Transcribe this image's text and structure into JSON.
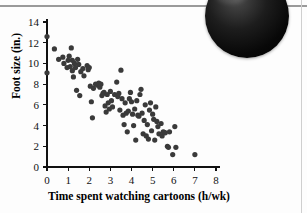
{
  "page": {
    "background_color": "#fdfdfd",
    "rule_color": "#9a9a9a",
    "decor": {
      "corner_blob_name": "dark-circle-photo-fragment",
      "corner_blob_color": "#0a0a0a"
    }
  },
  "chart_data": {
    "type": "scatter",
    "title": "",
    "xlabel": "Time spent watching cartoons (h/wk)",
    "ylabel": "Foot size (in.)",
    "xlim": [
      0,
      8
    ],
    "ylim": [
      0,
      14
    ],
    "xticks": [
      0,
      1,
      2,
      3,
      4,
      5,
      6,
      7,
      8
    ],
    "yticks": [
      0,
      2,
      4,
      6,
      8,
      10,
      12,
      14
    ],
    "xtick_labels": [
      "0",
      "1",
      "2",
      "3",
      "4",
      "5",
      "6",
      "7",
      "8"
    ],
    "ytick_labels": [
      "0",
      "2",
      "4",
      "6",
      "8",
      "10",
      "12",
      "14"
    ],
    "grid": false,
    "legend": null,
    "marker_color": "#3a3a3a",
    "marker_size": 2.6,
    "points": [
      [
        0.0,
        12.6
      ],
      [
        0.0,
        9.1
      ],
      [
        0.35,
        11.4
      ],
      [
        0.55,
        10.4
      ],
      [
        0.75,
        10.6
      ],
      [
        0.8,
        10.0
      ],
      [
        0.95,
        9.6
      ],
      [
        1.0,
        10.3
      ],
      [
        1.05,
        10.7
      ],
      [
        1.1,
        9.7
      ],
      [
        1.15,
        11.5
      ],
      [
        1.2,
        10.3
      ],
      [
        1.2,
        9.3
      ],
      [
        1.25,
        8.7
      ],
      [
        1.3,
        10.0
      ],
      [
        1.35,
        9.6
      ],
      [
        1.4,
        7.4
      ],
      [
        1.45,
        10.4
      ],
      [
        1.5,
        9.9
      ],
      [
        1.55,
        6.9
      ],
      [
        1.6,
        9.2
      ],
      [
        1.7,
        9.5
      ],
      [
        1.75,
        8.8
      ],
      [
        1.9,
        9.8
      ],
      [
        1.95,
        9.4
      ],
      [
        2.0,
        9.6
      ],
      [
        2.05,
        7.8
      ],
      [
        2.1,
        6.3
      ],
      [
        2.15,
        4.75
      ],
      [
        2.2,
        7.6
      ],
      [
        2.3,
        8.0
      ],
      [
        2.4,
        7.9
      ],
      [
        2.45,
        8.1
      ],
      [
        2.5,
        7.7
      ],
      [
        2.55,
        8.0
      ],
      [
        2.6,
        6.9
      ],
      [
        2.65,
        7.1
      ],
      [
        2.7,
        7.2
      ],
      [
        2.75,
        5.9
      ],
      [
        2.8,
        5.3
      ],
      [
        2.85,
        7.0
      ],
      [
        2.9,
        6.2
      ],
      [
        2.95,
        5.6
      ],
      [
        3.0,
        7.3
      ],
      [
        3.05,
        6.4
      ],
      [
        3.1,
        5.8
      ],
      [
        3.2,
        7.0
      ],
      [
        3.3,
        8.2
      ],
      [
        3.35,
        6.8
      ],
      [
        3.4,
        7.1
      ],
      [
        3.45,
        5.5
      ],
      [
        3.5,
        9.35
      ],
      [
        3.55,
        6.6
      ],
      [
        3.6,
        5.0
      ],
      [
        3.65,
        4.1
      ],
      [
        3.7,
        6.2
      ],
      [
        3.75,
        5.2
      ],
      [
        3.8,
        3.4
      ],
      [
        3.85,
        5.4
      ],
      [
        3.9,
        6.6
      ],
      [
        3.95,
        7.2
      ],
      [
        4.0,
        6.3
      ],
      [
        4.05,
        5.1
      ],
      [
        4.1,
        4.0
      ],
      [
        4.15,
        5.6
      ],
      [
        4.2,
        2.6
      ],
      [
        4.25,
        6.4
      ],
      [
        4.3,
        5.0
      ],
      [
        4.35,
        4.9
      ],
      [
        4.4,
        7.0
      ],
      [
        4.45,
        7.5
      ],
      [
        4.5,
        5.2
      ],
      [
        4.55,
        3.2
      ],
      [
        4.6,
        4.5
      ],
      [
        4.65,
        6.0
      ],
      [
        4.7,
        3.0
      ],
      [
        4.75,
        4.1
      ],
      [
        4.8,
        2.7
      ],
      [
        4.85,
        5.5
      ],
      [
        4.9,
        6.2
      ],
      [
        4.95,
        3.5
      ],
      [
        5.0,
        5.1
      ],
      [
        5.05,
        4.6
      ],
      [
        5.1,
        2.6
      ],
      [
        5.15,
        5.8
      ],
      [
        5.2,
        4.4
      ],
      [
        5.25,
        3.9
      ],
      [
        5.3,
        3.2
      ],
      [
        5.4,
        4.2
      ],
      [
        5.45,
        3.0
      ],
      [
        5.5,
        3.4
      ],
      [
        5.55,
        3.35
      ],
      [
        5.6,
        3.3
      ],
      [
        5.7,
        2.0
      ],
      [
        5.75,
        1.9
      ],
      [
        5.8,
        3.4
      ],
      [
        5.95,
        1.2
      ],
      [
        6.05,
        3.9
      ],
      [
        6.1,
        1.9
      ],
      [
        7.0,
        1.2
      ]
    ]
  },
  "axis_titles": {
    "x": "Time spent watching cartoons (h/wk)",
    "y": "Foot size (in.)"
  }
}
